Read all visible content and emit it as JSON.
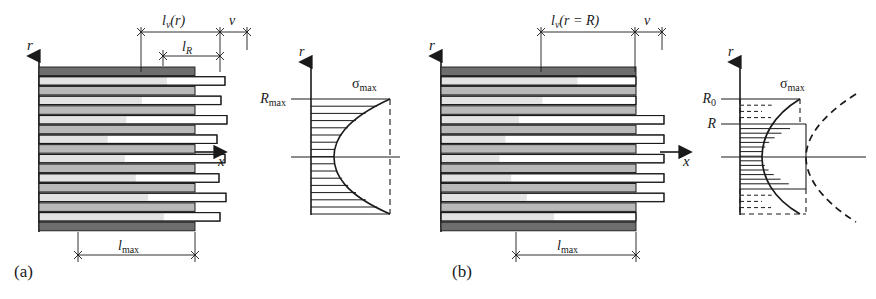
{
  "figure": {
    "type": "technical-diagram",
    "panels": [
      {
        "id": "a",
        "label": "(a)",
        "dimensions": {
          "top_left": "l_v(r)",
          "top_right": "v",
          "inner": "l_R",
          "bottom": "l_max"
        },
        "axes": {
          "vertical": "r",
          "horizontal": "x"
        },
        "stress_plot": {
          "axis_vertical": "r",
          "tick_labels": [
            "R_0"
          ],
          "peak_label": "σ_max",
          "curve": "parabolic, full height, solid",
          "hatch": "solid horizontal lines, full height"
        }
      },
      {
        "id": "b",
        "label": "(b)",
        "dimensions": {
          "top_left": "l_v(r = R)",
          "top_right": "v",
          "bottom": "l_max"
        },
        "axes": {
          "vertical": "r",
          "horizontal": "x"
        },
        "stress_plot": {
          "axis_vertical": "r",
          "tick_labels": [
            "R_0",
            "R"
          ],
          "peak_label": "σ_max",
          "curve": "parabolic truncated solid between R and -R, dashed continuation beyond",
          "hatch": "solid horizontal lines between R and -R, dashed hatch outside"
        }
      }
    ],
    "symbols": {
      "r": "r",
      "x": "x",
      "v": "v",
      "R": "R",
      "R0_base": "R",
      "R0_sub": "0",
      "l": "l",
      "l_sub_v": "v",
      "l_sub_R": "R",
      "l_sub_max": "max",
      "sigma": "σ",
      "sigma_sub": "max",
      "paren_r": "(r)",
      "paren_r_eq_R": "(r = R)"
    },
    "colors": {
      "band_dark": "#6e6e6e",
      "band_mid": "#b9b9b9",
      "band_light": "#e3e3e3",
      "band_white": "#ffffff",
      "stroke": "#1a1a1a",
      "background": "#ffffff"
    },
    "panel_a_rows": [
      {
        "kind": "dark",
        "white_start": 0.0,
        "protrude": 0
      },
      {
        "kind": "light",
        "white_start": 0.82,
        "protrude": 30
      },
      {
        "kind": "mid",
        "white_start": 0.0,
        "protrude": 0
      },
      {
        "kind": "light",
        "white_start": 0.66,
        "protrude": 26
      },
      {
        "kind": "mid",
        "white_start": 0.0,
        "protrude": 0
      },
      {
        "kind": "light",
        "white_start": 0.56,
        "protrude": 32
      },
      {
        "kind": "mid",
        "white_start": 0.0,
        "protrude": 0
      },
      {
        "kind": "light",
        "white_start": 0.44,
        "protrude": 22
      },
      {
        "kind": "mid",
        "white_start": 0.0,
        "protrude": 0
      },
      {
        "kind": "light",
        "white_start": 0.55,
        "protrude": 30
      },
      {
        "kind": "mid",
        "white_start": 0.0,
        "protrude": 0
      },
      {
        "kind": "light",
        "white_start": 0.62,
        "protrude": 24
      },
      {
        "kind": "mid",
        "white_start": 0.0,
        "protrude": 0
      },
      {
        "kind": "light",
        "white_start": 0.7,
        "protrude": 31
      },
      {
        "kind": "mid",
        "white_start": 0.0,
        "protrude": 0
      },
      {
        "kind": "light",
        "white_start": 0.8,
        "protrude": 25
      },
      {
        "kind": "dark",
        "white_start": 0.0,
        "protrude": 0
      }
    ],
    "panel_b_rows": [
      {
        "kind": "dark",
        "white_start": 0.0,
        "protrude": 0
      },
      {
        "kind": "light",
        "white_start": 0.7,
        "protrude": 0
      },
      {
        "kind": "mid",
        "white_start": 0.0,
        "protrude": 0
      },
      {
        "kind": "light",
        "white_start": 0.52,
        "protrude": 0
      },
      {
        "kind": "mid",
        "white_start": 0.0,
        "protrude": 0
      },
      {
        "kind": "light",
        "white_start": 0.4,
        "protrude": 28
      },
      {
        "kind": "mid",
        "white_start": 0.0,
        "protrude": 0
      },
      {
        "kind": "light",
        "white_start": 0.33,
        "protrude": 28
      },
      {
        "kind": "mid",
        "white_start": 0.0,
        "protrude": 0
      },
      {
        "kind": "light",
        "white_start": 0.3,
        "protrude": 28
      },
      {
        "kind": "mid",
        "white_start": 0.0,
        "protrude": 0
      },
      {
        "kind": "light",
        "white_start": 0.36,
        "protrude": 28
      },
      {
        "kind": "mid",
        "white_start": 0.0,
        "protrude": 0
      },
      {
        "kind": "light",
        "white_start": 0.44,
        "protrude": 28
      },
      {
        "kind": "mid",
        "white_start": 0.0,
        "protrude": 0
      },
      {
        "kind": "light",
        "white_start": 0.58,
        "protrude": 0
      },
      {
        "kind": "dark",
        "white_start": 0.0,
        "protrude": 0
      }
    ]
  }
}
